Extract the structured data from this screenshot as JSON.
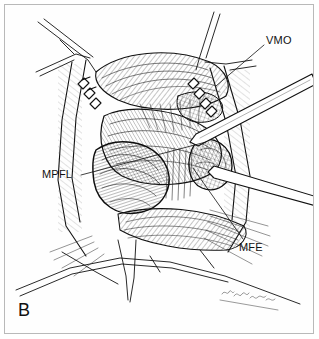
{
  "figure": {
    "panel_letter": "B",
    "domain": "medical-illustration",
    "style": "pen-and-ink line drawing with cross-hatching",
    "background_color": "#fefefe",
    "border_color": "#b9b9b9",
    "ink_color": "#111111",
    "signature": {
      "text": "",
      "description": "illegible cursive artist signature along lower-right skin edge",
      "visible": true
    }
  },
  "labels": [
    {
      "id": "vmo",
      "text": "VMO",
      "expansion_not_shown": true,
      "position": {
        "x": 266,
        "y": 34
      },
      "leader_line": {
        "from": [
          264,
          44
        ],
        "to": [
          215,
          86
        ]
      }
    },
    {
      "id": "mpfl",
      "text": "MPFL",
      "expansion_not_shown": true,
      "position": {
        "x": 42,
        "y": 168
      },
      "leader_line": {
        "from": [
          81,
          174
        ],
        "to": [
          205,
          142
        ]
      }
    },
    {
      "id": "mfe",
      "text": "MFE",
      "expansion_not_shown": true,
      "position": {
        "x": 239,
        "y": 241
      },
      "leader_line": {
        "from": [
          243,
          238
        ],
        "to": [
          192,
          168
        ]
      }
    }
  ],
  "anatomy_elements": [
    {
      "name": "vmo-muscle-belly",
      "note": "obliquely striated muscle fibers upper right"
    },
    {
      "name": "mpfl-ligament",
      "note": "broad fan-shaped fibrous band in center of field"
    },
    {
      "name": "mfe-medial-femoral-epicondyle",
      "note": "rounded bony prominence right of center"
    },
    {
      "name": "patella",
      "note": "rounded structure lower-left of center"
    },
    {
      "name": "retractor-teeth-left",
      "note": "row of toothed retractor hooks on left wound edge"
    },
    {
      "name": "retractor-teeth-right",
      "note": "row of toothed retractor hooks on right wound edge"
    },
    {
      "name": "instrument-shaft",
      "note": "long straight elevator crossing from upper right to mid field"
    },
    {
      "name": "skin-flap-upper-left",
      "note": "retracted skin and subcutaneous flap"
    },
    {
      "name": "skin-flap-lower",
      "note": "retracted skin edge along bottom of field"
    }
  ]
}
